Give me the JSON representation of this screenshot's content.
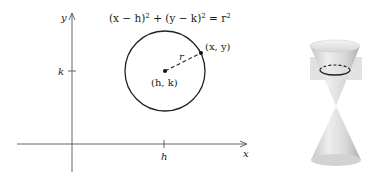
{
  "left_diagram": {
    "equation": {
      "part1": "(x − h)",
      "sup1": "2",
      "part2": " + (y − k)",
      "sup2": "2",
      "part3": " = r",
      "sup3": "2"
    },
    "axis_labels": {
      "x": "x",
      "y": "y"
    },
    "tick_labels": {
      "h": "h",
      "k": "k"
    },
    "center_label": "(h, k)",
    "point_label": "(x, y)",
    "radius_label": "r"
  },
  "right_diagram": {
    "description": "double-napped cone intersected by horizontal plane producing circle"
  },
  "colors": {
    "ink": "#1a1a1a",
    "axis": "#555555",
    "cone_light": "#e8e8e8",
    "cone_dark": "#b5b5b5",
    "plane": "#d9d9d9"
  }
}
